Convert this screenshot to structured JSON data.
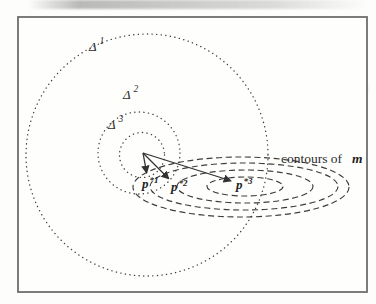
{
  "figure_labels": {
    "delta1": {
      "base": "Δ",
      "sup": "1"
    },
    "delta2": {
      "base": "Δ",
      "sup": "2"
    },
    "delta3": {
      "base": "Δ",
      "sup": "3"
    },
    "p_star_1": {
      "base": "p",
      "sup": "*1"
    },
    "p_star_2": {
      "base": "p",
      "sup": "*2"
    },
    "p_star_3": {
      "base": "p",
      "sup": "*3"
    },
    "contours_label": {
      "text": "contours of",
      "emphasis": "m"
    }
  },
  "colors": {
    "ink": "#383838",
    "frame_border": "#6e6e6e",
    "paper": "#fdfdfb"
  }
}
